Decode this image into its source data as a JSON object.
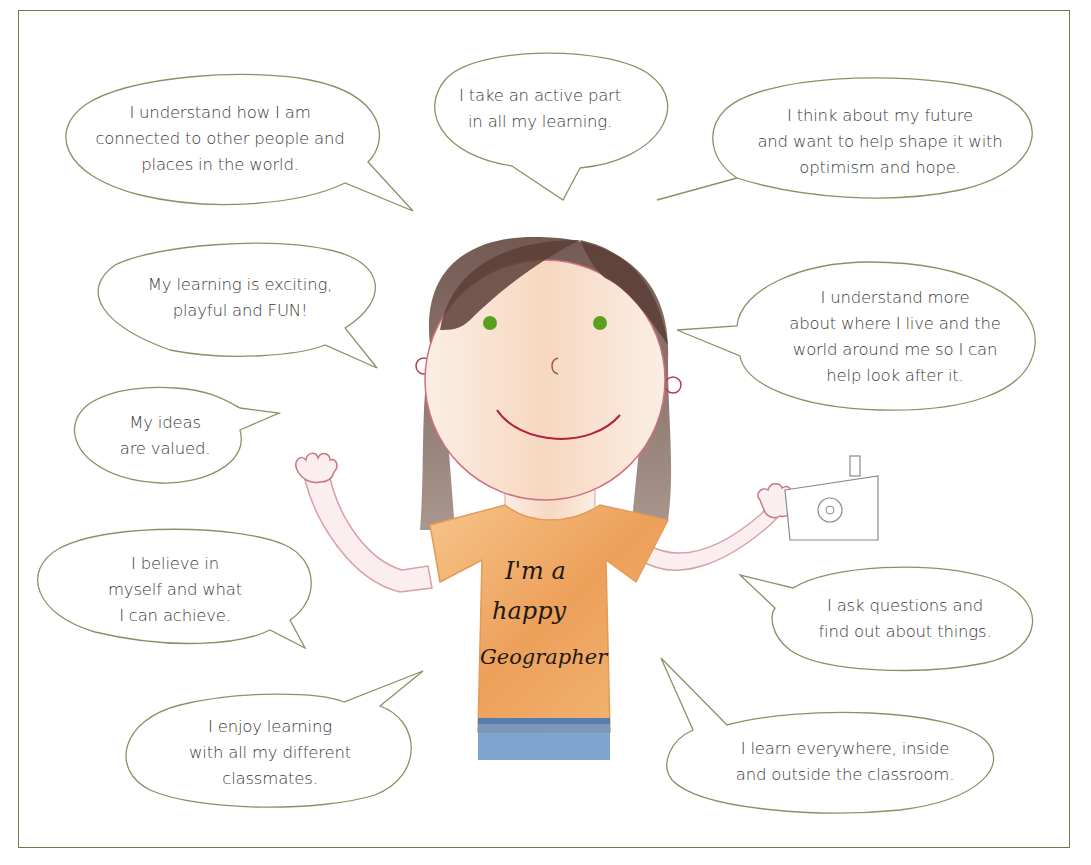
{
  "bubbles": [
    {
      "id": "connected",
      "text": "I understand how I am\nconnected to other people and\nplaces in the world."
    },
    {
      "id": "active",
      "text": "I take an active part\nin all my learning."
    },
    {
      "id": "future",
      "text": "I think about my future\nand want to help shape it with\noptimism and hope."
    },
    {
      "id": "fun",
      "text": "My learning is exciting,\nplayful and FUN!"
    },
    {
      "id": "where-i-live",
      "text": "I understand more\nabout where I live and the\nworld around me so I can\nhelp look after it."
    },
    {
      "id": "ideas",
      "text": "My ideas\nare valued."
    },
    {
      "id": "believe",
      "text": "I believe in\nmyself and what\nI can achieve."
    },
    {
      "id": "questions",
      "text": "I ask questions and\nfind out about things."
    },
    {
      "id": "classmates",
      "text": "I enjoy learning\nwith all my different\nclassmates."
    },
    {
      "id": "everywhere",
      "text": "I learn everywhere, inside\nand outside the classroom."
    }
  ],
  "drawing": {
    "shirt_line1": "I'm  a",
    "shirt_line2": "happy",
    "shirt_line3": "Geographer"
  },
  "colors": {
    "bubble_outline": "#7f8a5a",
    "frame_border": "#6f7a4a",
    "shirt": "#f0a860",
    "skin": "#f8e4d4",
    "hair": "#6a4a3e",
    "eyes": "#5aa020",
    "jeans": "#6a94c8"
  }
}
